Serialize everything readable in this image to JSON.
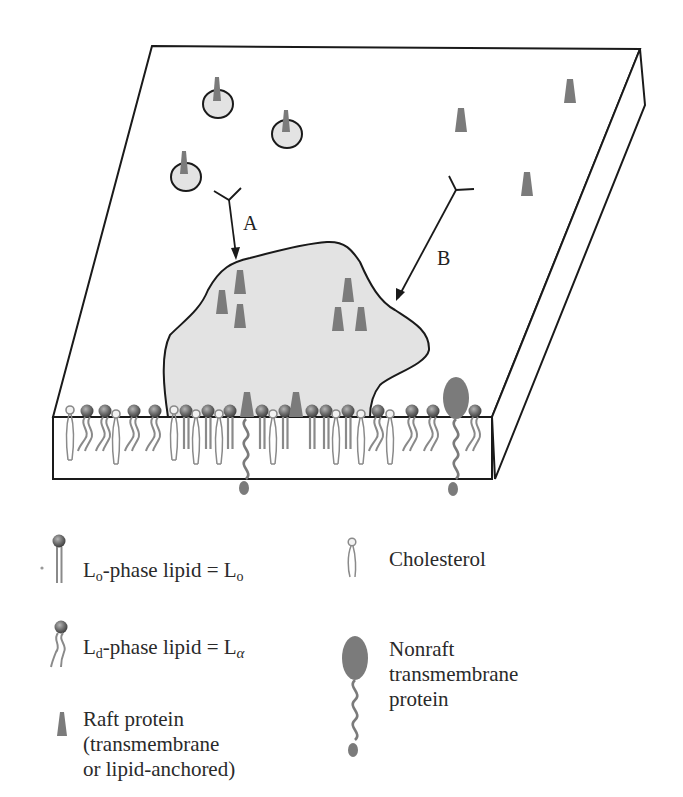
{
  "figure": {
    "colors": {
      "outline": "#1a1a1a",
      "raft_fill": "#e3e3e3",
      "protein": "#7b7b7b",
      "lipid_head": "#6e6e6e",
      "tail": "#8a8a8a",
      "background": "#ffffff"
    },
    "labels": {
      "arrow_a": "A",
      "arrow_b": "B"
    },
    "arrows": [
      {
        "id": "A",
        "from": [
          236,
          203
        ],
        "to": [
          233,
          258
        ],
        "label_pos": [
          244,
          230
        ]
      },
      {
        "id": "B",
        "from": [
          455,
          188
        ],
        "to": [
          397,
          298
        ],
        "label_pos": [
          435,
          262
        ]
      }
    ],
    "antibodies": [
      {
        "x": 236,
        "y": 203
      },
      {
        "x": 455,
        "y": 188
      }
    ],
    "vesicles": [
      {
        "cx": 218,
        "cy": 103,
        "r": 15,
        "protein": true
      },
      {
        "cx": 286,
        "cy": 131,
        "r": 15,
        "protein": true
      },
      {
        "cx": 186,
        "cy": 174,
        "r": 15,
        "protein": true
      }
    ],
    "surface_proteins": [
      {
        "x": 570,
        "y": 90
      },
      {
        "x": 461,
        "y": 118
      },
      {
        "x": 527,
        "y": 183
      }
    ],
    "raft_proteins": [
      {
        "x": 240,
        "y": 282
      },
      {
        "x": 222,
        "y": 300
      },
      {
        "x": 240,
        "y": 315
      },
      {
        "x": 348,
        "y": 290
      },
      {
        "x": 338,
        "y": 318
      },
      {
        "x": 361,
        "y": 318
      }
    ]
  },
  "legend": {
    "lo_lipid": {
      "prefix": "L",
      "sub": "o",
      "text": "-phase lipid = L",
      "sub2": "o"
    },
    "ld_lipid": {
      "prefix": "L",
      "sub": "d",
      "text": "-phase lipid = L",
      "sub2": "α"
    },
    "raft_protein": {
      "lines": [
        "Raft protein",
        "(transmembrane",
        "or lipid-anchored)"
      ]
    },
    "cholesterol": {
      "text": "Cholesterol"
    },
    "nonraft_protein": {
      "lines": [
        "Nonraft",
        "transmembrane",
        "protein"
      ]
    }
  }
}
